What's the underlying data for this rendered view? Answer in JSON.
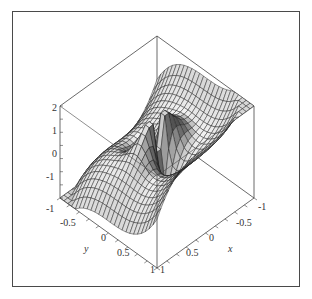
{
  "chart_data": {
    "type": "surface3d",
    "title": "",
    "function_description": "3D surface plot over x in [-1,1], y in [-1,1] with z in approx [-1.5, 2]; saddle-shaped with a spike discontinuity at origin (dark upward spike, light downward spike)",
    "xlabel": "x",
    "ylabel": "y",
    "zlabel": "",
    "x_range": [
      -1,
      1
    ],
    "y_range": [
      -1,
      1
    ],
    "z_range": [
      -1.5,
      2
    ],
    "x_ticks": [
      "-1",
      "-0.5",
      "0",
      "0.5",
      "1"
    ],
    "y_ticks": [
      "-1",
      "-0.5",
      "0",
      "0.5",
      "1"
    ],
    "z_ticks": [
      "2",
      "1",
      "0",
      "-1"
    ],
    "grid_resolution": 25,
    "style": "patch (shaded gray with black mesh lines)",
    "box": "boxed axes",
    "colors": {
      "frame": "#4a4a4a",
      "axes": "#444444",
      "mesh": "#1a1a1a",
      "surface_dark": "#555555",
      "surface_light": "#f2f2f2"
    }
  },
  "labels": {
    "z_ticks": [
      {
        "text": "2",
        "x": 52,
        "y": 108
      },
      {
        "text": "1",
        "x": 52,
        "y": 134
      },
      {
        "text": "0",
        "x": 52,
        "y": 155
      },
      {
        "text": "-1",
        "x": 46,
        "y": 177
      },
      {
        "text": "-1",
        "x": 46,
        "y": 212
      }
    ],
    "y_ticks": [
      {
        "text": "-0.5",
        "x": 62,
        "y": 224
      },
      {
        "text": "0",
        "x": 101,
        "y": 239
      },
      {
        "text": "0.5",
        "x": 118,
        "y": 254
      },
      {
        "text": "1",
        "x": 150,
        "y": 270
      }
    ],
    "x_ticks": [
      {
        "text": "-1",
        "x": 258,
        "y": 208
      },
      {
        "text": "-0.5",
        "x": 237,
        "y": 224
      },
      {
        "text": "0",
        "x": 209,
        "y": 239
      },
      {
        "text": "0.5",
        "x": 186,
        "y": 254
      },
      {
        "text": "1",
        "x": 160,
        "y": 270
      }
    ],
    "x_axis_label": {
      "text": "x",
      "x": 229,
      "y": 249
    },
    "y_axis_label": {
      "text": "y",
      "x": 84,
      "y": 249
    }
  }
}
